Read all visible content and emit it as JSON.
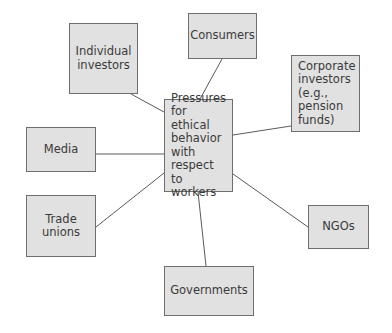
{
  "diagram": {
    "type": "hub-and-spoke",
    "center": {
      "id": "center",
      "label": "Pressures\nfor ethical\nbehavior\nwith\nrespect to\nworkers",
      "box": {
        "x": 164,
        "y": 99,
        "w": 69,
        "h": 93
      }
    },
    "nodes": [
      {
        "id": "individual-investors",
        "label": "Individual\ninvestors",
        "box": {
          "x": 69,
          "y": 23,
          "w": 69,
          "h": 71
        }
      },
      {
        "id": "consumers",
        "label": "Consumers",
        "box": {
          "x": 188,
          "y": 13,
          "w": 69,
          "h": 46
        }
      },
      {
        "id": "corporate-investors",
        "label": "Corporate\ninvestors\n(e.g.,\npension\nfunds)",
        "box": {
          "x": 291,
          "y": 55,
          "w": 69,
          "h": 77
        }
      },
      {
        "id": "media",
        "label": "Media",
        "box": {
          "x": 26,
          "y": 127,
          "w": 70,
          "h": 45
        }
      },
      {
        "id": "trade-unions",
        "label": "Trade\nunions",
        "box": {
          "x": 26,
          "y": 195,
          "w": 70,
          "h": 62
        }
      },
      {
        "id": "ngos",
        "label": "NGOs",
        "box": {
          "x": 308,
          "y": 205,
          "w": 61,
          "h": 44
        }
      },
      {
        "id": "governments",
        "label": "Governments",
        "box": {
          "x": 164,
          "y": 266,
          "w": 90,
          "h": 50
        }
      }
    ],
    "edges": [
      {
        "from": "individual-investors",
        "to": "center",
        "x1": 131,
        "y1": 94,
        "x2": 164,
        "y2": 112
      },
      {
        "from": "consumers",
        "to": "center",
        "x1": 222,
        "y1": 59,
        "x2": 200,
        "y2": 99
      },
      {
        "from": "corporate-investors",
        "to": "center",
        "x1": 291,
        "y1": 126,
        "x2": 233,
        "y2": 135
      },
      {
        "from": "media",
        "to": "center",
        "x1": 96,
        "y1": 154,
        "x2": 164,
        "y2": 154
      },
      {
        "from": "trade-unions",
        "to": "center",
        "x1": 96,
        "y1": 227,
        "x2": 164,
        "y2": 173
      },
      {
        "from": "ngos",
        "to": "center",
        "x1": 308,
        "y1": 227,
        "x2": 233,
        "y2": 174
      },
      {
        "from": "governments",
        "to": "center",
        "x1": 206,
        "y1": 266,
        "x2": 198,
        "y2": 192
      }
    ],
    "colors": {
      "box_fill": "#e1e1e1",
      "box_border": "#6e6e6e",
      "edge": "#5a5a5a",
      "text": "#3a3a3a"
    }
  }
}
